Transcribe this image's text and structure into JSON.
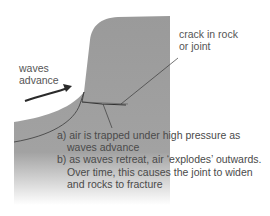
{
  "diagram": {
    "labels": {
      "waves_advance_line1": "waves",
      "waves_advance_line2": "advance",
      "crack_line1": "crack in rock",
      "crack_line2": "or joint"
    },
    "caption": {
      "a_line1": "a) air is trapped under high pressure as",
      "a_line2": "waves advance",
      "b_line1": "b) as waves retreat, air ‘explodes’ outwards.",
      "b_line2": "Over time, this causes the joint to widen",
      "b_line3": "and rocks to fracture"
    },
    "colors": {
      "rock": "#9a9a9a",
      "line": "#3a3a3a",
      "text": "#555555",
      "arrow": "#2a2a2a"
    }
  }
}
